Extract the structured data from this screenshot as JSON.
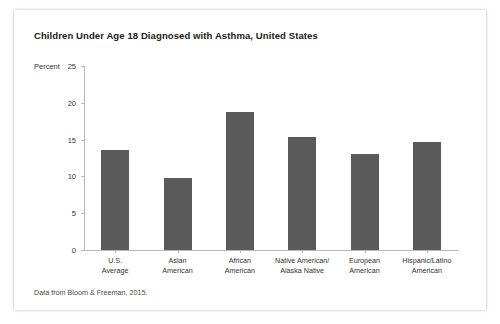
{
  "figure": {
    "title": "Children Under Age 18 Diagnosed with Asthma, United States",
    "source_note": "Data from Bloom & Freeman, 2015.",
    "bar_color": "#5a5a5a",
    "axis_color": "#b9b9b9"
  },
  "chart_data": {
    "type": "bar",
    "title": "Children Under Age 18 Diagnosed with Asthma, United States",
    "xlabel": "",
    "ylabel": "Percent",
    "ylim": [
      0,
      25
    ],
    "yticks": [
      0,
      5,
      10,
      15,
      20,
      25
    ],
    "grid": false,
    "legend": null,
    "categories": [
      "U.S.\nAverage",
      "Asian\nAmerican",
      "African\nAmerican",
      "Native American/\nAlaska Native",
      "European\nAmerican",
      "Hispanic/Latino\nAmerican"
    ],
    "category_lines": [
      [
        "U.S.",
        "Average"
      ],
      [
        "Asian",
        "American"
      ],
      [
        "African",
        "American"
      ],
      [
        "Native American/",
        "Alaska Native"
      ],
      [
        "European",
        "American"
      ],
      [
        "Hispanic/Latino",
        "American"
      ]
    ],
    "values": [
      13.6,
      9.8,
      18.7,
      15.4,
      13.1,
      14.7
    ],
    "annotation": "Data from Bloom & Freeman, 2015."
  }
}
